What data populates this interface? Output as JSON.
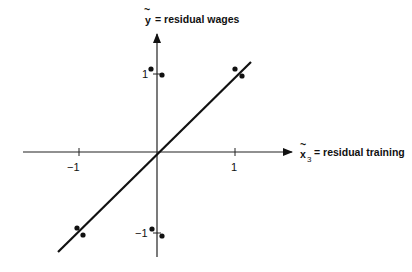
{
  "diagram": {
    "type": "scatter-with-regression-line",
    "y_axis": {
      "variable": "y",
      "decoration": "~",
      "label": "= residual wages"
    },
    "x_axis": {
      "variable": "x",
      "subscript": "3",
      "decoration": "~",
      "label": "= residual training"
    },
    "ticks": {
      "x_neg": "−1",
      "x_pos": "1",
      "y_pos": "1",
      "y_neg": "−1"
    },
    "points": [
      {
        "x": -0.05,
        "y": 1.05
      },
      {
        "x": 0.05,
        "y": 0.97
      },
      {
        "x": 0.95,
        "y": 1.05
      },
      {
        "x": 1.05,
        "y": 0.97
      },
      {
        "x": -1.05,
        "y": -0.97
      },
      {
        "x": -0.97,
        "y": -1.05
      },
      {
        "x": -0.05,
        "y": -0.97
      },
      {
        "x": 0.05,
        "y": -1.05
      }
    ],
    "regression_line": {
      "slope": 1,
      "intercept": 0
    },
    "colors": {
      "ink": "#111111",
      "background": "#ffffff"
    }
  }
}
